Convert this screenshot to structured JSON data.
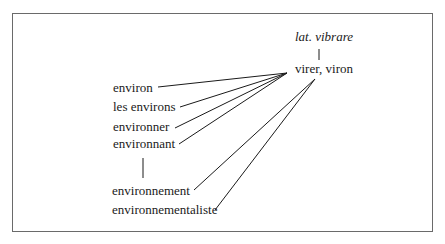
{
  "diagram": {
    "root": {
      "label": "lat. vibrare",
      "italic": true
    },
    "stem": {
      "label": "virer, viron"
    },
    "derivatives": [
      {
        "label": "environ"
      },
      {
        "label": "les environs"
      },
      {
        "label": "environner"
      },
      {
        "label": "environnant"
      },
      {
        "label": "environnement"
      },
      {
        "label": "environnementaliste"
      }
    ],
    "colors": {
      "line": "#1a1a1a",
      "border": "#6a6a6a",
      "text": "#1a1a1a"
    }
  }
}
